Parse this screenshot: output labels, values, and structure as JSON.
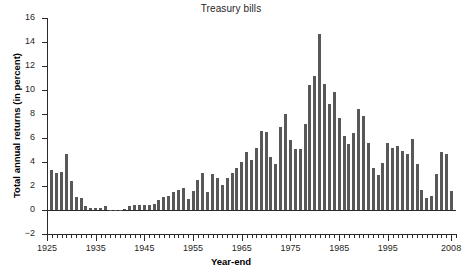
{
  "chart_data": {
    "type": "bar",
    "title": "Treasury bills",
    "xlabel": "Year-end",
    "ylabel": "Total annual returns (in percent)",
    "ylim": [
      -2,
      16
    ],
    "ytick_labels": [
      "16",
      "14",
      "12",
      "10",
      "8",
      "6",
      "4",
      "2",
      "0",
      "-2"
    ],
    "ytick_values": [
      16,
      14,
      12,
      10,
      8,
      6,
      4,
      2,
      0,
      -2
    ],
    "xtick_labels": [
      "1925",
      "1935",
      "1945",
      "1955",
      "1965",
      "1975",
      "1985",
      "1995",
      "2008"
    ],
    "xtick_values": [
      1925,
      1935,
      1945,
      1955,
      1965,
      1975,
      1985,
      1995,
      2008
    ],
    "xlim": [
      1925,
      2009
    ],
    "grid": false,
    "legend": false,
    "bar_color": "#585858",
    "axis_color": "#2a2a2a",
    "categories": [
      1926,
      1927,
      1928,
      1929,
      1930,
      1931,
      1932,
      1933,
      1934,
      1935,
      1936,
      1937,
      1938,
      1939,
      1940,
      1941,
      1942,
      1943,
      1944,
      1945,
      1946,
      1947,
      1948,
      1949,
      1950,
      1951,
      1952,
      1953,
      1954,
      1955,
      1956,
      1957,
      1958,
      1959,
      1960,
      1961,
      1962,
      1963,
      1964,
      1965,
      1966,
      1967,
      1968,
      1969,
      1970,
      1971,
      1972,
      1973,
      1974,
      1975,
      1976,
      1977,
      1978,
      1979,
      1980,
      1981,
      1982,
      1983,
      1984,
      1985,
      1986,
      1987,
      1988,
      1989,
      1990,
      1991,
      1992,
      1993,
      1994,
      1995,
      1996,
      1997,
      1998,
      1999,
      2000,
      2001,
      2002,
      2003,
      2004,
      2005,
      2006,
      2007,
      2008
    ],
    "values": [
      3.3,
      3.1,
      3.2,
      4.7,
      2.4,
      1.1,
      1.0,
      0.3,
      0.2,
      0.2,
      0.2,
      0.3,
      0.0,
      0.0,
      0.0,
      0.1,
      0.3,
      0.4,
      0.4,
      0.4,
      0.4,
      0.5,
      0.8,
      1.1,
      1.2,
      1.5,
      1.7,
      1.8,
      0.9,
      1.6,
      2.5,
      3.1,
      1.5,
      3.0,
      2.7,
      2.1,
      2.7,
      3.1,
      3.5,
      4.0,
      4.8,
      4.2,
      5.2,
      6.6,
      6.5,
      4.4,
      3.8,
      6.9,
      8.0,
      5.8,
      5.1,
      5.1,
      7.2,
      10.4,
      11.2,
      14.7,
      10.5,
      8.8,
      9.8,
      7.7,
      6.2,
      5.5,
      6.4,
      8.4,
      7.8,
      5.6,
      3.5,
      2.9,
      3.9,
      5.6,
      5.2,
      5.3,
      4.9,
      4.7,
      5.9,
      3.8,
      1.7,
      1.0,
      1.2,
      3.0,
      4.8,
      4.7,
      1.6
    ]
  }
}
